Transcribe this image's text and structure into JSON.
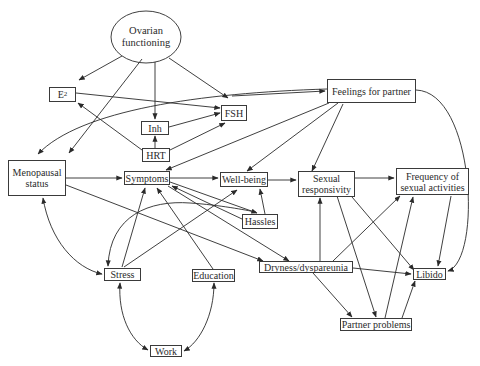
{
  "diagram": {
    "type": "path-diagram",
    "nodes": {
      "ovarian": {
        "label_line1": "Ovarian",
        "label_line2": "functioning",
        "shape": "ellipse"
      },
      "e2": {
        "label": "E",
        "subscript": "2"
      },
      "fsh": {
        "label": "FSH"
      },
      "inh": {
        "label": "Inh"
      },
      "hrt": {
        "label": "HRT"
      },
      "feelings": {
        "label": "Feelings for partner"
      },
      "menopausal": {
        "label_line1": "Menopausal",
        "label_line2": "status"
      },
      "symptoms": {
        "label": "Symptoms"
      },
      "wellbeing": {
        "label": "Well-being"
      },
      "sexual_resp": {
        "label_line1": "Sexual",
        "label_line2": "responsivity"
      },
      "frequency": {
        "label_line1": "Frequency of",
        "label_line2": "sexual activities"
      },
      "hassles": {
        "label": "Hassles"
      },
      "stress": {
        "label": "Stress"
      },
      "education": {
        "label": "Education"
      },
      "dryness": {
        "label": "Dryness/dyspareunia"
      },
      "libido": {
        "label": "Libido"
      },
      "partner_problems": {
        "label": "Partner problems"
      },
      "work": {
        "label": "Work"
      }
    },
    "edges": [
      {
        "from": "Ovarian functioning",
        "to": "E2"
      },
      {
        "from": "Ovarian functioning",
        "to": "Menopausal status"
      },
      {
        "from": "Ovarian functioning",
        "to": "Inh"
      },
      {
        "from": "Ovarian functioning",
        "to": "FSH"
      },
      {
        "from": "E2",
        "to": "FSH"
      },
      {
        "from": "HRT",
        "to": "E2"
      },
      {
        "from": "HRT",
        "to": "Inh"
      },
      {
        "from": "HRT",
        "to": "FSH"
      },
      {
        "from": "Inh",
        "to": "FSH"
      },
      {
        "from": "Feelings for partner",
        "to": "Menopausal status",
        "curved": true,
        "note": "line from Feelings runs left to Menopausal status"
      },
      {
        "from": "Menopausal status",
        "to": "Feelings for partner"
      },
      {
        "from": "Feelings for partner",
        "to": "Symptoms"
      },
      {
        "from": "Feelings for partner",
        "to": "Well-being"
      },
      {
        "from": "Feelings for partner",
        "to": "Sexual responsivity"
      },
      {
        "from": "Feelings for partner",
        "to": "Libido",
        "curved": true
      },
      {
        "from": "Menopausal status",
        "to": "Symptoms"
      },
      {
        "from": "Menopausal status",
        "to": "Dryness/dyspareunia"
      },
      {
        "from": "Menopausal status",
        "to": "Stress",
        "bidirectional": true,
        "curved": true
      },
      {
        "from": "Symptoms",
        "to": "Well-being"
      },
      {
        "from": "Symptoms",
        "to": "Hassles",
        "bidirectional": true
      },
      {
        "from": "Symptoms",
        "to": "Dryness/dyspareunia"
      },
      {
        "from": "Well-being",
        "to": "Sexual responsivity"
      },
      {
        "from": "Hassles",
        "to": "Well-being"
      },
      {
        "from": "Stress",
        "to": "Symptoms"
      },
      {
        "from": "Stress",
        "to": "Well-being"
      },
      {
        "from": "Stress",
        "to": "Hassles",
        "curved": true
      },
      {
        "from": "Stress",
        "to": "Work",
        "bidirectional": true,
        "curved": true
      },
      {
        "from": "Education",
        "to": "Symptoms"
      },
      {
        "from": "Education",
        "to": "Work",
        "bidirectional": true,
        "curved": true
      },
      {
        "from": "Sexual responsivity",
        "to": "Frequency of sexual activities"
      },
      {
        "from": "Sexual responsivity",
        "to": "Libido"
      },
      {
        "from": "Sexual responsivity",
        "to": "Partner problems"
      },
      {
        "from": "Dryness/dyspareunia",
        "to": "Sexual responsivity"
      },
      {
        "from": "Dryness/dyspareunia",
        "to": "Frequency of sexual activities"
      },
      {
        "from": "Dryness/dyspareunia",
        "to": "Libido"
      },
      {
        "from": "Dryness/dyspareunia",
        "to": "Partner problems"
      },
      {
        "from": "Frequency of sexual activities",
        "to": "Libido"
      },
      {
        "from": "Partner problems",
        "to": "Frequency of sexual activities"
      },
      {
        "from": "Partner problems",
        "to": "Libido"
      }
    ],
    "colors": {
      "line": "#2a2a2a",
      "text": "#2a2a2a",
      "background": "#ffffff"
    }
  }
}
